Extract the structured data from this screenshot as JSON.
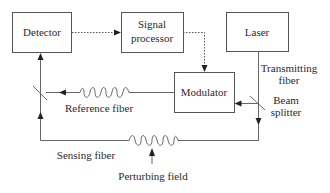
{
  "diagram": {
    "blocks": {
      "detector": "Detector",
      "signal_processor_line1": "Signal",
      "signal_processor_line2": "processor",
      "laser": "Laser",
      "modulator": "Modulator"
    },
    "labels": {
      "transmitting_fiber_line1": "Transmitting",
      "transmitting_fiber_line2": "fiber",
      "beam_splitter_line1": "Beam",
      "beam_splitter_line2": "splitter",
      "reference_fiber": "Reference fiber",
      "sensing_fiber": "Sensing fiber",
      "perturbing_field": "Perturbing field"
    }
  }
}
